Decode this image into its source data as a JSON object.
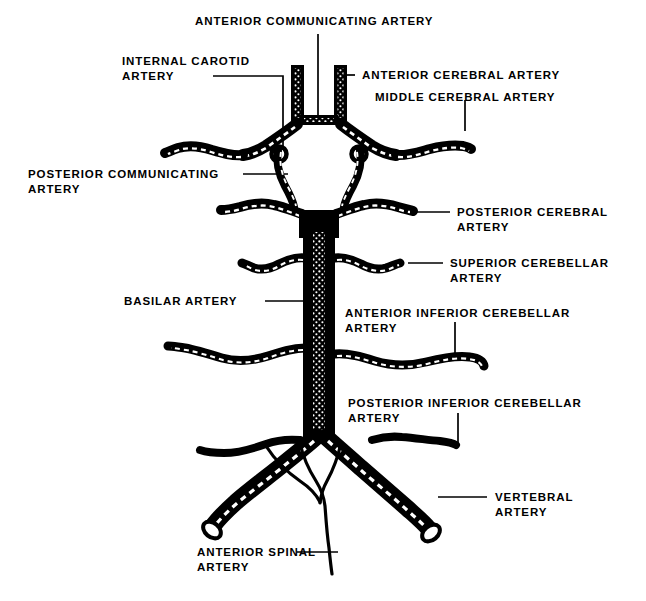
{
  "figure": {
    "type": "anatomical-line-diagram",
    "background_color": "#ffffff",
    "vessel_color": "#000000",
    "highlight_color": "#ffffff",
    "leader_color": "#000000"
  },
  "labels": {
    "anterior_communicating": "ANTERIOR COMMUNICATING ARTERY",
    "internal_carotid_l1": "INTERNAL CAROTID",
    "internal_carotid_l2": "ARTERY",
    "anterior_cerebral": "ANTERIOR CEREBRAL ARTERY",
    "middle_cerebral": "MIDDLE CEREBRAL ARTERY",
    "posterior_communicating_l1": "POSTERIOR COMMUNICATING",
    "posterior_communicating_l2": "ARTERY",
    "posterior_cerebral_l1": "POSTERIOR CEREBRAL",
    "posterior_cerebral_l2": "ARTERY",
    "superior_cerebellar_l1": "SUPERIOR CEREBELLAR",
    "superior_cerebellar_l2": "ARTERY",
    "basilar": "BASILAR ARTERY",
    "anterior_inferior_cerebellar_l1": "ANTERIOR INFERIOR CEREBELLAR",
    "anterior_inferior_cerebellar_l2": "ARTERY",
    "posterior_inferior_cerebellar_l1": "POSTERIOR INFERIOR CEREBELLAR",
    "posterior_inferior_cerebellar_l2": "ARTERY",
    "vertebral_l1": "VERTEBRAL",
    "vertebral_l2": "ARTERY",
    "anterior_spinal_l1": "ANTERIOR SPINAL",
    "anterior_spinal_l2": "ARTERY"
  }
}
